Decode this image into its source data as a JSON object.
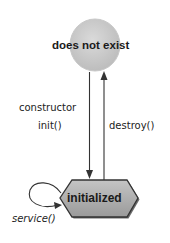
{
  "diagram": {
    "type": "state-diagram",
    "states": [
      {
        "id": "does-not-exist",
        "label": "does not exist",
        "shape": "circle",
        "fill": "#cccccc"
      },
      {
        "id": "initialized",
        "label": "initialized",
        "shape": "hexagon",
        "fill": "#a9a9a9"
      }
    ],
    "transitions": [
      {
        "from": "does-not-exist",
        "to": "initialized",
        "label_lines": [
          "constructor",
          "init()"
        ]
      },
      {
        "from": "initialized",
        "to": "does-not-exist",
        "label": "destroy()"
      },
      {
        "from": "initialized",
        "to": "initialized",
        "label": "service()"
      }
    ],
    "labels": {
      "top_state": "does not exist",
      "bottom_state": "initialized",
      "constructor": "constructor",
      "init": "init()",
      "destroy": "destroy()",
      "service": "service()"
    },
    "colors": {
      "circle_fill": "#cccccc",
      "hexagon_fill": "#a9a9a9",
      "stroke": "#333333"
    }
  }
}
